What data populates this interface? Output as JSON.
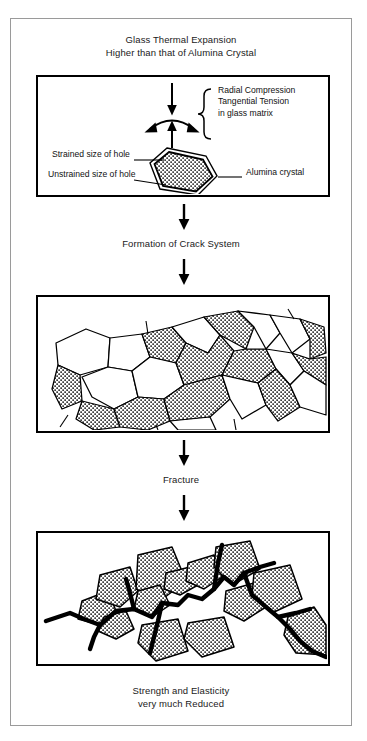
{
  "document": {
    "type": "process-flow-diagram",
    "subject": "Microcracking of glass-alumina composite due to thermal expansion mismatch"
  },
  "top_caption": {
    "line1": "Glass Thermal Expansion",
    "line2": "Higher than that of Alumina Crystal"
  },
  "panel1": {
    "name": "single-crystal-stress-panel",
    "stress_note": {
      "line1": "Radial Compression",
      "line2": "Tangential Tension",
      "line3": "in glass matrix"
    },
    "labels": {
      "strained": "Strained size of hole",
      "unstrained": "Unstrained size of hole",
      "crystal": "Alumina crystal"
    },
    "arrows": {
      "down": "down-arrow",
      "up": "up-arrow",
      "tangential_arc": "double-headed-arc-arrow"
    }
  },
  "connector1": {
    "arrow": "down-arrow",
    "label": "Formation of Crack System"
  },
  "panel2": {
    "name": "crack-system-microstructure-panel",
    "description": "Polycrystalline microstructure: irregular polygonal grains, stippled grains are alumina crystals, white grains are glass matrix, thin lines are crack system"
  },
  "connector2": {
    "arrow": "down-arrow",
    "label": "Fracture"
  },
  "panel3": {
    "name": "fracture-path-panel",
    "description": "Thick black fracture crack propagating around stippled alumina grains"
  },
  "bottom_caption": {
    "line1": "Strength and Elasticity",
    "line2": "very much Reduced"
  },
  "colors": {
    "ink": "#000000",
    "frame": "#9a9a9a",
    "paper": "#ffffff",
    "stipple": "#000000"
  }
}
